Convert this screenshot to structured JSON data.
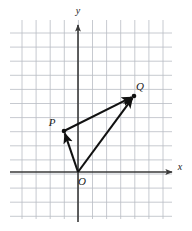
{
  "figure": {
    "type": "vector-diagram",
    "background_color": "#ffffff",
    "grid": {
      "color": "#b9bcc4",
      "line_width": 0.8,
      "spacing_px": 14.1,
      "x_start_px": 22,
      "x_end_px": 164,
      "y_start_px": 20,
      "y_end_px": 219,
      "visible": true
    },
    "axes": {
      "color": "#3a3a3a",
      "line_width": 1.6,
      "origin_px": {
        "x": 78,
        "y": 172
      },
      "x_axis": {
        "label": "x",
        "label_px": {
          "x": 180,
          "y": 170
        },
        "start_px": {
          "x": 10,
          "y": 172
        },
        "end_px": {
          "x": 172,
          "y": 172
        },
        "arrow": "right"
      },
      "y_axis": {
        "label": "y",
        "label_px": {
          "x": 78,
          "y": 14
        },
        "start_px": {
          "x": 78,
          "y": 222
        },
        "end_px": {
          "x": 78,
          "y": 25
        },
        "arrow": "up"
      }
    },
    "points": [
      {
        "name": "O",
        "label": "O",
        "px": {
          "x": 78,
          "y": 172
        },
        "label_px": {
          "x": 82,
          "y": 185
        },
        "dot": false,
        "grid_coords": [
          0,
          0
        ]
      },
      {
        "name": "P",
        "label": "P",
        "px": {
          "x": 64,
          "y": 131
        },
        "label_px": {
          "x": 52,
          "y": 126
        },
        "dot": true,
        "grid_coords": [
          -1,
          3
        ]
      },
      {
        "name": "Q",
        "label": "Q",
        "px": {
          "x": 134,
          "y": 96
        },
        "label_px": {
          "x": 140,
          "y": 90
        },
        "dot": true,
        "grid_coords": [
          4,
          5
        ]
      }
    ],
    "vectors": [
      {
        "name": "OP",
        "from": "O",
        "to": "P",
        "label": "",
        "color": "#111111",
        "width": 2.1,
        "arrowhead": "end"
      },
      {
        "name": "OQ",
        "from": "O",
        "to": "Q",
        "label": "",
        "color": "#111111",
        "width": 2.1,
        "arrowhead": "end"
      },
      {
        "name": "PQ",
        "from": "P",
        "to": "Q",
        "label": "",
        "color": "#111111",
        "width": 2.1,
        "arrowhead": "end"
      }
    ],
    "colors": {
      "grid": "#b9bcc4",
      "axis": "#3a3a3a",
      "vector": "#111111",
      "label": "#1a1a1a"
    }
  }
}
